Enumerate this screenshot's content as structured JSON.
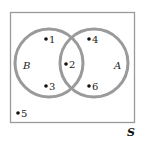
{
  "diagram": {
    "type": "venn",
    "universe_label": "S",
    "sets": [
      {
        "name": "B",
        "elements_only": [
          "1",
          "3"
        ]
      },
      {
        "name": "A",
        "elements_only": [
          "4",
          "6"
        ]
      }
    ],
    "intersection": [
      "2"
    ],
    "outside": [
      "5"
    ],
    "points": [
      {
        "label": "1",
        "region": "B only"
      },
      {
        "label": "2",
        "region": "A and B"
      },
      {
        "label": "3",
        "region": "B only"
      },
      {
        "label": "4",
        "region": "A only"
      },
      {
        "label": "5",
        "region": "outside"
      },
      {
        "label": "6",
        "region": "A only"
      }
    ],
    "colors": {
      "circle_stroke": "#9a9a9a",
      "frame_stroke": "#9a9a9a",
      "dot": "#111111"
    }
  }
}
